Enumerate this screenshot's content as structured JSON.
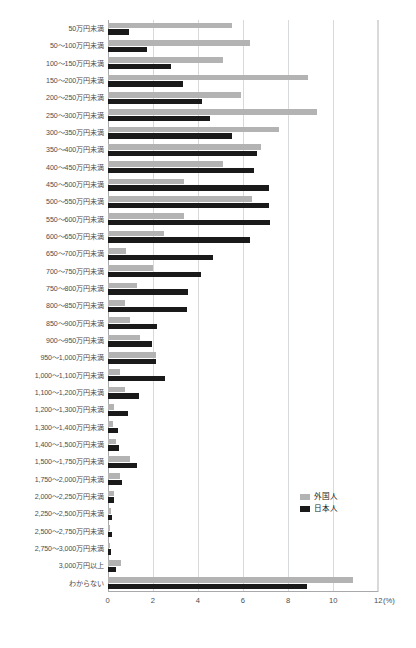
{
  "chart_data": {
    "type": "bar",
    "orientation": "horizontal",
    "title": "",
    "xlabel": "(%)",
    "ylabel": "",
    "xlim": [
      0,
      12
    ],
    "xticks": [
      "0",
      "2",
      "4",
      "6",
      "8",
      "10",
      "12"
    ],
    "xunit": "(%)",
    "grid": true,
    "legend_position": "center-right",
    "categories": [
      "50万円未満",
      "50〜100万円未満",
      "100〜150万円未満",
      "150〜200万円未満",
      "200〜250万円未満",
      "250〜300万円未満",
      "300〜350万円未満",
      "350〜400万円未満",
      "400〜450万円未満",
      "450〜500万円未満",
      "500〜550万円未満",
      "550〜600万円未満",
      "600〜650万円未満",
      "650〜700万円未満",
      "700〜750万円未満",
      "750〜800万円未満",
      "800〜850万円未満",
      "850〜900万円未満",
      "900〜950万円未満",
      "950〜1,000万円未満",
      "1,000〜1,100万円未満",
      "1,100〜1,200万円未満",
      "1,200〜1,300万円未満",
      "1,300〜1,400万円未満",
      "1,400〜1,500万円未満",
      "1,500〜1,750万円未満",
      "1,750〜2,000万円未満",
      "2,000〜2,250万円未満",
      "2,250〜2,500万円未満",
      "2,500〜2,750万円未満",
      "2,750〜3,000万円未満",
      "3,000万円以上",
      "わからない"
    ],
    "series": [
      {
        "name": "外国人",
        "color": "#b3b3b3",
        "values": [
          5.5,
          6.3,
          5.1,
          8.9,
          5.9,
          9.3,
          7.6,
          6.8,
          5.1,
          3.4,
          6.4,
          3.4,
          2.5,
          0.8,
          2.0,
          1.3,
          0.75,
          1.0,
          1.45,
          2.15,
          0.55,
          0.75,
          0.3,
          0.25,
          0.35,
          1.0,
          0.55,
          0.3,
          0.15,
          0.1,
          0.1,
          0.6,
          10.9
        ]
      },
      {
        "name": "日本人",
        "color": "#1a1a1a",
        "values": [
          0.95,
          1.75,
          2.8,
          3.35,
          4.2,
          4.55,
          5.5,
          6.6,
          6.5,
          7.15,
          7.15,
          7.2,
          6.3,
          4.65,
          4.15,
          3.55,
          3.5,
          2.2,
          1.95,
          2.15,
          2.55,
          1.4,
          0.9,
          0.45,
          0.5,
          1.3,
          0.65,
          0.3,
          0.2,
          0.2,
          0.15,
          0.35,
          8.85
        ]
      }
    ]
  },
  "legend": {
    "items": [
      {
        "label": "外国人",
        "color": "#b3b3b3"
      },
      {
        "label": "日本人",
        "color": "#1a1a1a"
      }
    ]
  }
}
